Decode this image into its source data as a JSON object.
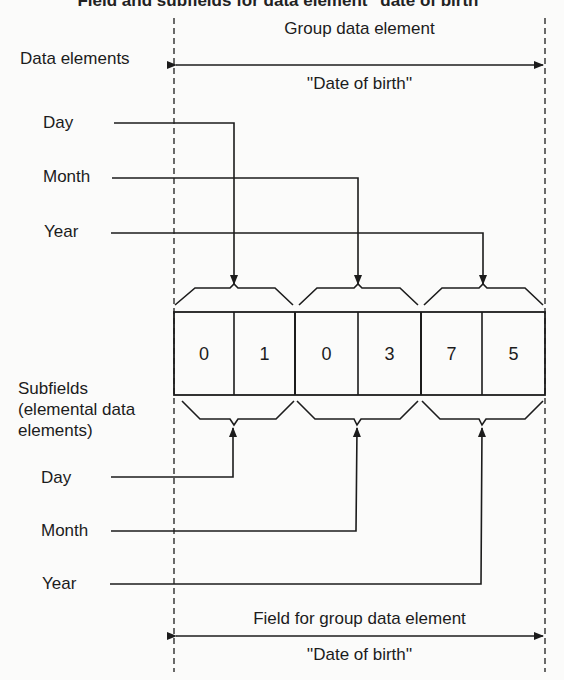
{
  "title": "Field and subfields for data element \"date of birth\"",
  "top": {
    "group_label": "Group data element",
    "group_name": "''Date of birth''",
    "section_label": "Data elements",
    "elements": [
      "Day",
      "Month",
      "Year"
    ]
  },
  "field": {
    "cells": [
      "0",
      "1",
      "0",
      "3",
      "7",
      "5"
    ]
  },
  "bottom": {
    "section_label_lines": [
      "Subfields",
      "(elemental data",
      "elements)"
    ],
    "elements": [
      "Day",
      "Month",
      "Year"
    ],
    "field_label": "Field for group data element",
    "field_name": "''Date of birth''"
  },
  "colors": {
    "ink": "#1c1c1c",
    "paper": "#fbfbfa"
  }
}
